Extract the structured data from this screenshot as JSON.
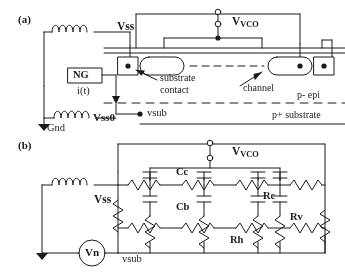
{
  "figure": {
    "panel_a": {
      "label": "(a)",
      "nodes": {
        "vss": "Vss",
        "vvco_prefix": "V",
        "vvco_sub": "VCO",
        "vss0": "Vss0",
        "vsub": "vsub",
        "gnd": "Gnd"
      },
      "source": {
        "name": "NG",
        "current": "i(t)"
      },
      "annotations": {
        "substrate_contact_line1": "substrate",
        "substrate_contact_line2": "contact",
        "channel": "channel",
        "p_epi": "p- epi",
        "p_substrate": "p+ substrate"
      }
    },
    "panel_b": {
      "label": "(b)",
      "nodes": {
        "vss": "Vss",
        "vvco_prefix": "V",
        "vvco_sub": "VCO",
        "vsub": "vsub",
        "vn": "Vn"
      },
      "components": {
        "cc": "Cc",
        "cb": "Cb",
        "rc": "Rc",
        "rv": "Rv",
        "rh": "Rh"
      }
    }
  }
}
